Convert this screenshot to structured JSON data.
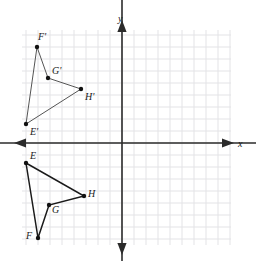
{
  "figure": {
    "background_color": "#ffffff",
    "grid_color": "#e3e3e6",
    "axis_color": "#2b2b2b",
    "shape_color": "#1a1a1a",
    "image_shape_color": "#555555",
    "vertex_color": "#111111"
  },
  "axes": {
    "x_label": "x",
    "y_label": "y",
    "x_axis_pixel_y": 143,
    "y_axis_pixel_x": 122,
    "grid_spacing_px": 12,
    "grid_left_px": 22,
    "grid_right_px": 231,
    "grid_top_px": 30,
    "grid_bottom_px": 245,
    "x_label_pos": {
      "x": 238,
      "y": 139
    },
    "y_label_pos": {
      "x": 118,
      "y": 14
    }
  },
  "chart_data": {
    "type": "scatter",
    "xlabel": "x",
    "ylabel": "y",
    "grid": true,
    "legend": "none",
    "xlim": [
      -8.33,
      9.08
    ],
    "ylim": [
      -8.5,
      9.42
    ],
    "series": [
      {
        "name": "EFGH",
        "closed": true,
        "points": [
          {
            "label": "E",
            "px": 26,
            "py": 163,
            "x": -8,
            "y": -1.67
          },
          {
            "label": "F",
            "px": 38,
            "py": 238,
            "x": -7,
            "y": -7.92
          },
          {
            "label": "G",
            "px": 49,
            "py": 205,
            "x": -6.08,
            "y": -5.17
          },
          {
            "label": "H",
            "px": 84,
            "py": 196,
            "x": -3.17,
            "y": -4.42
          }
        ],
        "label_offsets": [
          {
            "label": "E",
            "lx": 30,
            "ly": 151
          },
          {
            "label": "F",
            "lx": 26,
            "ly": 231
          },
          {
            "label": "G",
            "lx": 52,
            "ly": 205
          },
          {
            "label": "H",
            "lx": 88,
            "ly": 189
          }
        ]
      },
      {
        "name": "E'F'G'H'",
        "closed": true,
        "points": [
          {
            "label": "E'",
            "px": 26,
            "py": 124,
            "x": -8,
            "y": 1.58
          },
          {
            "label": "F'",
            "px": 37,
            "py": 47,
            "x": -7.08,
            "y": 8.0
          },
          {
            "label": "G'",
            "px": 48,
            "py": 78,
            "x": -6.17,
            "y": 5.42
          },
          {
            "label": "H'",
            "px": 81,
            "py": 89,
            "x": -3.42,
            "y": 4.5
          }
        ],
        "label_offsets": [
          {
            "label": "E'",
            "lx": 30,
            "ly": 127
          },
          {
            "label": "F'",
            "lx": 38,
            "ly": 32
          },
          {
            "label": "G'",
            "lx": 52,
            "ly": 66
          },
          {
            "label": "H'",
            "lx": 85,
            "ly": 92
          }
        ]
      }
    ]
  }
}
